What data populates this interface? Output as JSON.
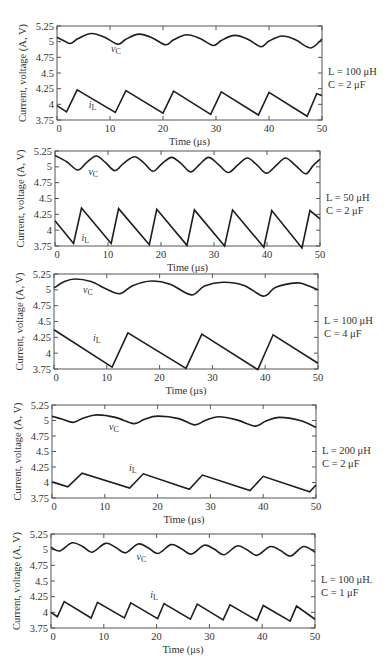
{
  "chart_data": [
    {
      "type": "line",
      "title": "",
      "xlabel": "Time (μs)",
      "ylabel": "Current, voltage (A, V)",
      "xlim": [
        0,
        50
      ],
      "ylim": [
        3.75,
        5.25
      ],
      "xticks": [
        0,
        10,
        20,
        30,
        40,
        50
      ],
      "yticks": [
        "3.75",
        "4",
        "4.25",
        "4.5",
        "4.75",
        "5",
        "5.25"
      ],
      "grid": false,
      "annotation": [
        "L = 100 μH",
        "C = 2 μF"
      ],
      "frame": {
        "left": 57,
        "top": 26,
        "right": 322,
        "bottom": 120
      },
      "series": [
        {
          "name": "vC",
          "label_main": "v",
          "label_sub": "C",
          "label_at": [
            10.2,
            4.83
          ],
          "smooth": true,
          "x": [
            0,
            1.2,
            2.5,
            4,
            6.5,
            9,
            11.5,
            13,
            15.5,
            18,
            20.5,
            22,
            24.5,
            27,
            29.5,
            31,
            33.5,
            36,
            38.5,
            40,
            42.5,
            45,
            47.8,
            50
          ],
          "y": [
            5.07,
            5.02,
            4.97,
            5.05,
            5.13,
            5.07,
            4.96,
            5.04,
            5.12,
            5.06,
            4.95,
            5.03,
            5.11,
            5.05,
            4.94,
            5.02,
            5.1,
            5.04,
            4.92,
            5.01,
            5.09,
            5.03,
            4.9,
            5.04
          ]
        },
        {
          "name": "iL",
          "label_main": "i",
          "label_sub": "L",
          "label_at": [
            6.0,
            3.94
          ],
          "smooth": false,
          "x": [
            0,
            1.8,
            3.8,
            11,
            13,
            20,
            22,
            29,
            31,
            38,
            40,
            47.2,
            49,
            50
          ],
          "y": [
            3.98,
            3.88,
            4.23,
            3.87,
            4.22,
            3.86,
            4.21,
            3.84,
            4.2,
            3.83,
            4.19,
            3.81,
            4.17,
            4.14
          ]
        }
      ]
    },
    {
      "type": "line",
      "title": "",
      "xlabel": "Time (μs)",
      "ylabel": "Current, voltage (A, V)",
      "xlim": [
        0,
        50
      ],
      "ylim": [
        3.75,
        5.25
      ],
      "xticks": [
        0,
        10,
        20,
        30,
        40,
        50
      ],
      "yticks": [
        "3.75",
        "4",
        "4.25",
        "4.5",
        "4.75",
        "5",
        "5.25"
      ],
      "grid": false,
      "annotation": [
        "L = 50 μH",
        "C = 2 μF"
      ],
      "frame": {
        "left": 55,
        "top": 151,
        "right": 320,
        "bottom": 246
      },
      "series": [
        {
          "name": "vC",
          "label_main": "v",
          "label_sub": "C",
          "label_at": [
            6.3,
            4.87
          ],
          "smooth": true,
          "x": [
            0,
            2.2,
            4.3,
            6,
            7.8,
            9.5,
            11.3,
            13,
            15,
            16.8,
            18.5,
            20.2,
            22,
            23.8,
            25.6,
            27.3,
            29,
            30.8,
            32.7,
            34.5,
            36.3,
            38.1,
            39.9,
            41.7,
            43.5,
            45.4,
            47.3,
            48.7,
            50
          ],
          "y": [
            5.18,
            5.08,
            4.95,
            5.07,
            5.17,
            5.07,
            4.94,
            5.06,
            5.16,
            5.06,
            4.93,
            5.05,
            5.15,
            5.05,
            4.92,
            5.04,
            5.15,
            5.04,
            4.91,
            5.03,
            5.14,
            5.03,
            4.9,
            5.02,
            5.14,
            5.02,
            4.89,
            5.02,
            5.12
          ]
        },
        {
          "name": "iL",
          "label_main": "i",
          "label_sub": "L",
          "label_at": [
            5.0,
            3.83
          ],
          "smooth": false,
          "x": [
            0,
            3.5,
            5,
            10.6,
            12,
            17.8,
            19.2,
            24.9,
            26.3,
            32,
            33.5,
            39.4,
            40.9,
            46.6,
            48.1,
            50
          ],
          "y": [
            4.15,
            3.79,
            4.35,
            3.79,
            4.34,
            3.77,
            4.33,
            3.76,
            4.32,
            3.75,
            4.32,
            3.73,
            4.31,
            3.72,
            4.31,
            4.18
          ]
        }
      ]
    },
    {
      "type": "line",
      "title": "",
      "xlabel": "Time (μs)",
      "ylabel": "Current, voltage (A, V)",
      "xlim": [
        0,
        50
      ],
      "ylim": [
        3.75,
        5.25
      ],
      "xticks": [
        0,
        10,
        20,
        30,
        40,
        50
      ],
      "yticks": [
        "3.75",
        "4",
        "4.25",
        "4.5",
        "4.75",
        "5",
        "5.25"
      ],
      "grid": false,
      "annotation": [
        "L = 100 μH",
        "C = 4 μF"
      ],
      "frame": {
        "left": 54,
        "top": 274,
        "right": 318,
        "bottom": 369
      },
      "series": [
        {
          "name": "vC",
          "label_main": "v",
          "label_sub": "C",
          "label_at": [
            5.5,
            4.95
          ],
          "smooth": true,
          "x": [
            0,
            2,
            4,
            7,
            10,
            12.5,
            15,
            18.5,
            22,
            26,
            28.5,
            32,
            36,
            39.7,
            42,
            46,
            48,
            50
          ],
          "y": [
            5.03,
            5.13,
            5.17,
            5.13,
            5.01,
            4.94,
            5.07,
            5.14,
            5.09,
            4.92,
            5.06,
            5.12,
            5.07,
            4.9,
            5.04,
            5.11,
            5.07,
            5.0
          ]
        },
        {
          "name": "iL",
          "label_main": "i",
          "label_sub": "L",
          "label_at": [
            7.4,
            4.19
          ],
          "smooth": false,
          "x": [
            0,
            11,
            14,
            25,
            28,
            38.6,
            41.5,
            50
          ],
          "y": [
            4.37,
            3.78,
            4.32,
            3.76,
            4.3,
            3.74,
            4.29,
            3.84
          ]
        }
      ]
    },
    {
      "type": "line",
      "title": "",
      "xlabel": "Time (μs)",
      "ylabel": "Current, voltage (A, V)",
      "xlim": [
        0,
        50
      ],
      "ylim": [
        3.75,
        5.25
      ],
      "xticks": [
        0,
        10,
        20,
        30,
        40,
        50
      ],
      "yticks": [
        "3.75",
        "4",
        "4.25",
        "4.5",
        "4.75",
        "5",
        "5.25"
      ],
      "grid": false,
      "annotation": [
        "L = 200 μH",
        "C = 2 μF"
      ],
      "frame": {
        "left": 52,
        "top": 405,
        "right": 316,
        "bottom": 498
      },
      "series": [
        {
          "name": "vC",
          "label_main": "v",
          "label_sub": "C",
          "label_at": [
            10.8,
            4.84
          ],
          "smooth": true,
          "x": [
            0,
            2,
            4,
            6,
            8.5,
            12,
            15.5,
            17.5,
            20,
            24,
            27,
            29,
            31.5,
            35,
            38.5,
            40.5,
            43,
            47,
            50
          ],
          "y": [
            5.07,
            5.02,
            4.97,
            5.04,
            5.09,
            5.05,
            4.95,
            5.02,
            5.07,
            5.03,
            4.93,
            5.0,
            5.06,
            5.01,
            4.91,
            4.99,
            5.05,
            5.0,
            4.89
          ]
        },
        {
          "name": "iL",
          "label_main": "i",
          "label_sub": "L",
          "label_at": [
            14.6,
            4.19
          ],
          "smooth": false,
          "x": [
            0,
            3,
            5.7,
            14.7,
            17.3,
            26,
            28.5,
            37.5,
            40,
            48.8,
            50
          ],
          "y": [
            4.01,
            3.93,
            4.15,
            3.91,
            4.14,
            3.89,
            4.12,
            3.87,
            4.1,
            3.85,
            3.96
          ]
        }
      ]
    },
    {
      "type": "line",
      "title": "",
      "xlabel": "Time (μs)",
      "ylabel": "Current, voltage (A, V)",
      "xlim": [
        0,
        50
      ],
      "ylim": [
        3.75,
        5.25
      ],
      "xticks": [
        0,
        10,
        20,
        30,
        40,
        50
      ],
      "yticks": [
        "3.75",
        "4",
        "4.25",
        "4.5",
        "4.75",
        "5",
        "5.25"
      ],
      "grid": false,
      "annotation": [
        "L = 100 μH.",
        "C = 1 μF"
      ],
      "frame": {
        "left": 51,
        "top": 534,
        "right": 315,
        "bottom": 628
      },
      "series": [
        {
          "name": "vC",
          "label_main": "v",
          "label_sub": "C",
          "label_at": [
            16.2,
            4.83
          ],
          "smooth": true,
          "x": [
            0,
            1.6,
            4,
            6,
            7.8,
            10.3,
            12.2,
            14.1,
            16.5,
            18.4,
            20.3,
            22.7,
            24.6,
            26.6,
            29,
            30.9,
            32.8,
            35.2,
            37.1,
            39,
            41.5,
            43.4,
            45.4,
            47.8,
            50
          ],
          "y": [
            5.04,
            4.98,
            5.11,
            5.05,
            4.96,
            5.1,
            5.04,
            4.95,
            5.09,
            5.03,
            4.94,
            5.08,
            5.02,
            4.93,
            5.07,
            5.01,
            4.92,
            5.06,
            5.0,
            4.91,
            5.05,
            4.99,
            4.9,
            5.05,
            4.96
          ]
        },
        {
          "name": "iL",
          "label_main": "i",
          "label_sub": "L",
          "label_at": [
            18.8,
            4.23
          ],
          "smooth": false,
          "x": [
            0,
            1.2,
            2.5,
            7.6,
            8.8,
            13.9,
            15.1,
            20.2,
            21.4,
            26.4,
            27.7,
            32.6,
            33.9,
            39,
            40.2,
            45.3,
            46.5,
            50
          ],
          "y": [
            4.0,
            3.93,
            4.17,
            3.91,
            4.16,
            3.91,
            4.15,
            3.9,
            4.14,
            3.89,
            4.13,
            3.88,
            4.12,
            3.87,
            4.11,
            3.86,
            4.1,
            3.89
          ]
        }
      ]
    }
  ],
  "style": {
    "line_color": "#1e1e1e",
    "frame_color": "#555555",
    "text_color": "#333333",
    "background": "#ffffff"
  }
}
